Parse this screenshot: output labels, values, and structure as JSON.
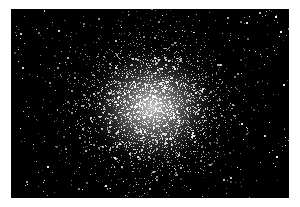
{
  "image": {
    "subject": "globular star cluster",
    "description": "Dense spherical cluster of stars on black sky background, bright white core fading outward into scattered individual stars",
    "colors": {
      "background_border": "#ffffff",
      "sky": "#000000",
      "core": "#ebebeb",
      "stars": "#ffffff"
    },
    "frame": {
      "left": 11,
      "top": 9,
      "width": 278,
      "height": 189
    },
    "cluster_center": {
      "x": 141,
      "y": 98
    },
    "cluster_radius": {
      "rx": 70,
      "ry": 62
    }
  }
}
